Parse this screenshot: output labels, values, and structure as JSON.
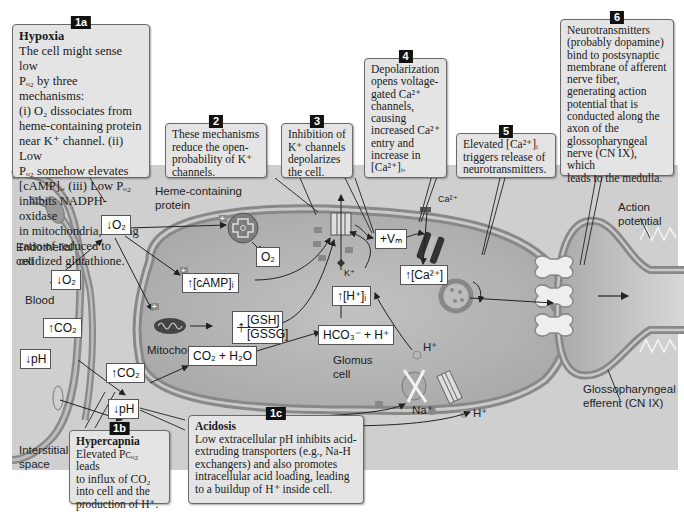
{
  "callouts": {
    "c1a": {
      "num": "1a",
      "title": "Hypoxia",
      "lines": [
        "The cell might sense low",
        "Pₒ₂ by three mechanisms:",
        "(i) O₂ dissociates from",
        "heme-containing protein",
        "near K⁺ channel. (ii) Low",
        "Pₒ₂ somehow elevates",
        "[cAMP]ᵢ. (iii) Low Pₒ₂",
        "inhibits NADPH-oxidase",
        "in mitochondria, raising",
        "ratio of reduced to",
        "oxidized glutathione."
      ]
    },
    "c2": {
      "num": "2",
      "lines": [
        "These mechanisms",
        "reduce the open-",
        "probability of K⁺",
        "channels."
      ]
    },
    "c3": {
      "num": "3",
      "lines": [
        "Inhibition of",
        "K⁺ channels",
        "depolarizes",
        "the cell."
      ]
    },
    "c4": {
      "num": "4",
      "lines": [
        "Depolarization",
        "opens voltage-",
        "gated Ca²⁺",
        "channels,",
        "causing",
        "increased Ca²⁺",
        "entry and",
        "increase in",
        "[Ca²⁺]ᵢ."
      ]
    },
    "c5": {
      "num": "5",
      "lines": [
        "Elevated [Ca²⁺]ᵢ",
        "triggers release of",
        "neurotransmitters."
      ]
    },
    "c6": {
      "num": "6",
      "lines": [
        "Neurotransmitters",
        "(probably dopamine)",
        "bind to postsynaptic",
        "membrane of afferent",
        "nerve fiber,",
        "generating action",
        "potential that is",
        "conducted along the",
        "axon of the",
        "glossopharyngeal",
        "nerve (CN IX), which",
        "leads to the medulla."
      ]
    },
    "c1b": {
      "num": "1b",
      "title": "Hypercapnia",
      "lines": [
        "Elevated Pᴄₒ₂ leads",
        "to influx of CO₂",
        "into cell and the",
        "production of H⁺."
      ]
    },
    "c1c": {
      "num": "1c",
      "title": "Acidosis",
      "lines": [
        "Low extracellular pH inhibits acid-",
        "extruding transporters (e.g., Na-H",
        "exchangers) and also promotes",
        "intracellular acid loading, leading",
        "to a buildup of H⁺ inside cell."
      ]
    }
  },
  "labels": {
    "heme": [
      "Heme-containing",
      "protein"
    ],
    "endothelial": [
      "Endothelial",
      "cell"
    ],
    "blood": "Blood",
    "mitochondrion": "Mitochondrion",
    "glomus": [
      "Glomus",
      "cell"
    ],
    "interstitial": [
      "Interstitial",
      "space"
    ],
    "action_potential": [
      "Action",
      "potential"
    ],
    "glosso": [
      "Glossopharyngeal",
      "efferent (CN IX)"
    ],
    "k_ion": "K⁺",
    "ca_ion": "Ca²⁺",
    "na_ion": "Na⁺",
    "h_ion_in": "H⁺",
    "h_ion_out": "H⁺"
  },
  "boxes": {
    "o2_down_center": "↓O₂",
    "o2_down_blood": "↓O₂",
    "co2_up_blood": "↑CO₂",
    "ph_down_blood": "↓pH",
    "co2_up_int": "↑CO₂",
    "ph_down_int": "↓pH",
    "camp": "↑[cAMP]ᵢ",
    "o2_released": "O₂",
    "gsh_num": "[GSH]",
    "gsh_den": "[GSSG]",
    "gsh_arrow": "↑",
    "co2_h2o": "CO₂ + H₂O",
    "hco3": "HCO₃⁻ + H⁺",
    "h_in": "↑[H⁺]ᵢ",
    "vm": "+Vₘ",
    "ca_in": "↑[Ca²⁺]"
  },
  "colors": {
    "background": "#cfcfcf",
    "cell_fill": "#b3b3b3",
    "membrane": "#8a8a8a",
    "callout_bg": "#e4e4e4",
    "badge": "#111111"
  }
}
